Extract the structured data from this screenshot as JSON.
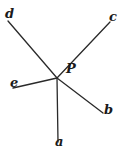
{
  "diagram": {
    "center": {
      "label": "P",
      "x": 57,
      "y": 78,
      "label_x": 66,
      "label_y": 73
    },
    "rays": [
      {
        "label": "a",
        "x": 58,
        "y": 142,
        "label_x": 55,
        "label_y": 145
      },
      {
        "label": "b",
        "x": 103,
        "y": 113,
        "label_x": 104,
        "label_y": 113
      },
      {
        "label": "c",
        "x": 110,
        "y": 22,
        "label_x": 109,
        "label_y": 21
      },
      {
        "label": "d",
        "x": 8,
        "y": 21,
        "label_x": 6,
        "label_y": 18
      },
      {
        "label": "e",
        "x": 13,
        "y": 88,
        "label_x": 10,
        "label_y": 86
      }
    ],
    "colors": {
      "line": "#2a2a2a",
      "text": "#1a1a1a",
      "background": "#ffffff"
    }
  }
}
